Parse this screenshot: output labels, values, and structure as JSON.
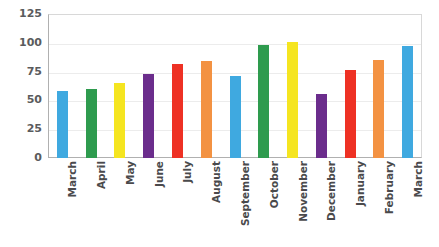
{
  "chart_data": {
    "type": "bar",
    "title": "",
    "xlabel": "",
    "ylabel": "",
    "ylim": [
      0,
      125
    ],
    "yticks": [
      0,
      25,
      50,
      75,
      100,
      125
    ],
    "grid": true,
    "legend": "none",
    "categories": [
      "March",
      "April",
      "May",
      "June",
      "July",
      "August",
      "September",
      "October",
      "November",
      "December",
      "January",
      "February",
      "March"
    ],
    "values": [
      58,
      60,
      65,
      73,
      82,
      84,
      71,
      98,
      101,
      56,
      76,
      85,
      97
    ],
    "colors": [
      "#3FA9E0",
      "#2E9B4E",
      "#F5E520",
      "#6B2D8C",
      "#EE3124",
      "#F39242",
      "#3FA9E0",
      "#2E9B4E",
      "#F5E520",
      "#6B2D8C",
      "#EE3124",
      "#F39242",
      "#3FA9E0"
    ]
  },
  "style": {
    "plot_background": "#FFFFFF",
    "gridline_color": "#ECECEC",
    "axis_color": "#B0B0B0",
    "tick_label_color": "#5A5B5D"
  }
}
